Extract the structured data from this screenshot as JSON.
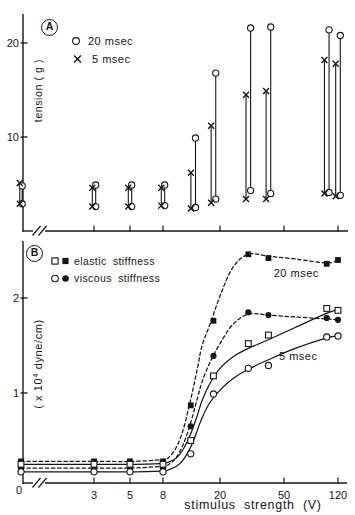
{
  "figure": {
    "background": "#ffffff",
    "ink": "#161616"
  },
  "chart_data": [
    {
      "panel": "A",
      "type": "range-bars",
      "ylabel": "tension ( g )",
      "yticks": [
        10,
        20
      ],
      "ylim": [
        0,
        23
      ],
      "xticks": [
        3,
        5,
        8,
        20,
        50,
        120
      ],
      "axis_break": true,
      "x_values": [
        0,
        3,
        5,
        8,
        13,
        18,
        30,
        40,
        100,
        120
      ],
      "legend": [
        {
          "symbol": "open-circle",
          "label": "20 msec"
        },
        {
          "symbol": "x",
          "label": "5 msec"
        }
      ],
      "series": [
        {
          "name": "20 msec",
          "symbol": "open-circle",
          "ranges": [
            [
              2.9,
              4.8
            ],
            [
              2.6,
              4.9
            ],
            [
              2.6,
              4.9
            ],
            [
              2.7,
              4.9
            ],
            [
              2.5,
              9.9
            ],
            [
              3.4,
              16.8
            ],
            [
              4.3,
              21.6
            ],
            [
              4.0,
              21.7
            ],
            [
              4.1,
              21.4
            ],
            [
              3.8,
              20.8
            ]
          ]
        },
        {
          "name": "5 msec",
          "symbol": "x",
          "ranges": [
            [
              2.9,
              5.1
            ],
            [
              2.6,
              4.6
            ],
            [
              2.6,
              4.6
            ],
            [
              2.7,
              4.6
            ],
            [
              2.4,
              6.2
            ],
            [
              3.0,
              11.2
            ],
            [
              3.4,
              14.5
            ],
            [
              3.4,
              14.9
            ],
            [
              4.0,
              18.2
            ],
            [
              3.7,
              17.8
            ]
          ]
        }
      ]
    },
    {
      "panel": "B",
      "type": "line",
      "ylabel": "( x 10^4 dyne/cm)",
      "ylabel_parts": {
        "prefix": "( x 10",
        "sup": "4",
        "suffix": " dyne/cm)"
      },
      "xlabel": "stimulus strength (V)",
      "yticks": [
        1,
        2
      ],
      "ylim": [
        0,
        2.6
      ],
      "axis_break": true,
      "xticks": [
        {
          "v": 0,
          "label": "0"
        },
        {
          "v": 3,
          "label": "3"
        },
        {
          "v": 5,
          "label": "5"
        },
        {
          "v": 8,
          "label": "8"
        },
        {
          "v": 20,
          "label": "20"
        },
        {
          "v": 50,
          "label": "50"
        },
        {
          "v": 120,
          "label": "120"
        }
      ],
      "x_values": [
        0,
        3,
        5,
        8,
        12.5,
        18,
        30,
        40,
        100,
        120
      ],
      "legend": [
        {
          "symbols": [
            "open-square",
            "filled-square"
          ],
          "label": "elastic stiffness"
        },
        {
          "symbols": [
            "open-circle",
            "filled-circle"
          ],
          "label": "viscous stiffness"
        }
      ],
      "annotations": [
        {
          "text": "20 msec",
          "v": 61,
          "y": 2.26
        },
        {
          "text": "5 msec",
          "v": 63,
          "y": 1.38
        }
      ],
      "series": [
        {
          "name": "elastic stiffness 20 msec",
          "symbol": "filled-square",
          "line": "dashed",
          "values": [
            0.28,
            0.28,
            0.28,
            0.28,
            0.87,
            1.76,
            2.46,
            2.42,
            2.36,
            2.4
          ],
          "curve": {
            "v": [
              0,
              3,
              5,
              8,
              9,
              10,
              11,
              12,
              13,
              14,
              15,
              17,
              20,
              24,
              30,
              40,
              60,
              100,
              120
            ],
            "s": [
              0.28,
              0.28,
              0.28,
              0.3,
              0.34,
              0.44,
              0.6,
              0.82,
              1.05,
              1.28,
              1.5,
              1.72,
              2.02,
              2.32,
              2.46,
              2.44,
              2.41,
              2.37,
              2.4
            ]
          }
        },
        {
          "name": "viscous stiffness 20 msec",
          "symbol": "filled-circle",
          "line": "dashed",
          "values": [
            0.21,
            0.21,
            0.21,
            0.21,
            0.65,
            1.39,
            1.85,
            1.82,
            1.79,
            1.77
          ],
          "curve": {
            "v": [
              0,
              3,
              5,
              8,
              9,
              10,
              11,
              12,
              13,
              14,
              15,
              17,
              20,
              24,
              30,
              40,
              60,
              100,
              120
            ],
            "s": [
              0.21,
              0.21,
              0.21,
              0.23,
              0.26,
              0.33,
              0.45,
              0.6,
              0.78,
              0.96,
              1.12,
              1.32,
              1.52,
              1.72,
              1.83,
              1.82,
              1.8,
              1.78,
              1.77
            ]
          }
        },
        {
          "name": "elastic stiffness 5 msec",
          "symbol": "open-square",
          "line": "solid",
          "values": [
            0.25,
            0.25,
            0.25,
            0.25,
            0.5,
            1.18,
            1.52,
            1.61,
            1.89,
            1.87
          ],
          "curve": {
            "v": [
              0,
              3,
              5,
              8,
              9,
              10,
              11,
              12,
              13,
              14,
              15,
              17,
              20,
              24,
              30,
              40,
              60,
              100,
              120
            ],
            "s": [
              0.25,
              0.25,
              0.25,
              0.26,
              0.28,
              0.32,
              0.4,
              0.51,
              0.64,
              0.78,
              0.92,
              1.1,
              1.26,
              1.38,
              1.47,
              1.56,
              1.69,
              1.84,
              1.88
            ]
          }
        },
        {
          "name": "viscous stiffness 5 msec",
          "symbol": "open-circle",
          "line": "solid",
          "values": [
            0.17,
            0.17,
            0.17,
            0.17,
            0.36,
            0.99,
            1.26,
            1.29,
            1.59,
            1.6
          ],
          "curve": {
            "v": [
              0,
              3,
              5,
              8,
              9,
              10,
              11,
              12,
              13,
              14,
              15,
              17,
              20,
              24,
              30,
              40,
              60,
              100,
              120
            ],
            "s": [
              0.17,
              0.17,
              0.17,
              0.18,
              0.2,
              0.23,
              0.29,
              0.38,
              0.49,
              0.62,
              0.74,
              0.9,
              1.03,
              1.15,
              1.25,
              1.35,
              1.47,
              1.58,
              1.6
            ]
          }
        }
      ]
    }
  ]
}
